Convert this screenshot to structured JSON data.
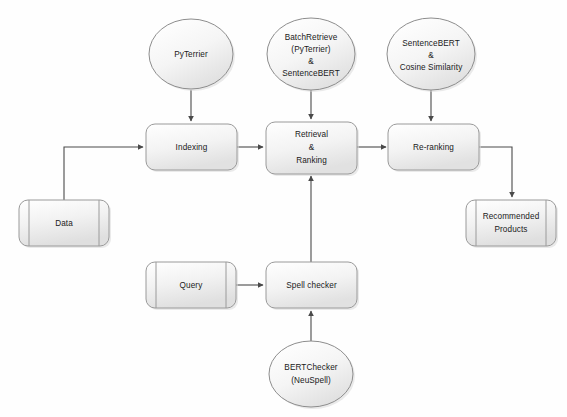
{
  "diagram": {
    "background_color": "#fefefe",
    "edge_color": "#4a4a4a",
    "shape_border_color": "#9a9a9a",
    "shape_fill_start": "#ffffff",
    "shape_fill_end": "#e3e3e3",
    "nodes": {
      "pyterrier": {
        "label_line1": "PyTerrier",
        "shape": "ellipse"
      },
      "batch_retrieve": {
        "label_line1": "BatchRetrieve",
        "label_line2": "(PyTerrier)",
        "label_line3": "&",
        "label_line4": "SentenceBERT",
        "shape": "ellipse"
      },
      "sentence_bert_cosine": {
        "label_line1": "SentenceBERT",
        "label_line2": "&",
        "label_line3": "Cosine Similarity",
        "shape": "ellipse"
      },
      "indexing": {
        "label_line1": "Indexing",
        "shape": "process"
      },
      "retrieval_ranking": {
        "label_line1": "Retrieval",
        "label_line2": "&",
        "label_line3": "Ranking",
        "shape": "process"
      },
      "reranking": {
        "label_line1": "Re-ranking",
        "shape": "process"
      },
      "data": {
        "label_line1": "Data",
        "shape": "predefined-process"
      },
      "recommended_products": {
        "label_line1": "Recommended",
        "label_line2": "Products",
        "shape": "predefined-process"
      },
      "query": {
        "label_line1": "Query",
        "shape": "predefined-process"
      },
      "spell_checker": {
        "label_line1": "Spell checker",
        "shape": "process"
      },
      "bert_checker": {
        "label_line1": "BERTChecker",
        "label_line2": "(NeuSpell)",
        "shape": "ellipse"
      }
    },
    "edges": [
      {
        "from": "pyterrier",
        "to": "indexing"
      },
      {
        "from": "batch_retrieve",
        "to": "retrieval_ranking"
      },
      {
        "from": "sentence_bert_cosine",
        "to": "reranking"
      },
      {
        "from": "data",
        "to": "indexing"
      },
      {
        "from": "indexing",
        "to": "retrieval_ranking"
      },
      {
        "from": "retrieval_ranking",
        "to": "reranking"
      },
      {
        "from": "reranking",
        "to": "recommended_products"
      },
      {
        "from": "query",
        "to": "spell_checker"
      },
      {
        "from": "bert_checker",
        "to": "spell_checker"
      },
      {
        "from": "spell_checker",
        "to": "retrieval_ranking"
      }
    ]
  }
}
